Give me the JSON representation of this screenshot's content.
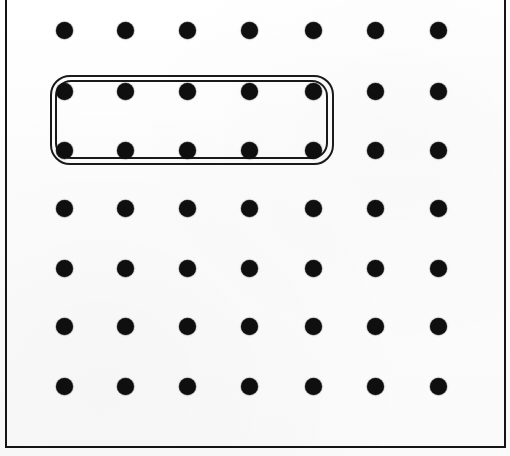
{
  "figure": {
    "name": "dot-grid-with-selection",
    "width": 510,
    "height": 456,
    "background_color": "#fdfdfd",
    "ink_color": "#100f0f"
  },
  "frame": {
    "name": "page-border",
    "color": "#141414",
    "left_x": 5,
    "right_x": 504,
    "top_y": -2,
    "bottom_y": 446,
    "stroke_width": 2.2
  },
  "grid": {
    "columns": 7,
    "rows": 6,
    "dot_diameter": 17,
    "column_x": [
      64,
      125,
      187,
      249,
      313,
      375,
      438
    ],
    "row_y": [
      30,
      91,
      150,
      208,
      268,
      326,
      386
    ],
    "row_count_note": "6 visible rows of dots",
    "rows_y_used": [
      30,
      91,
      150,
      208,
      268,
      326,
      386
    ],
    "dots": [
      {
        "row": 1,
        "col": 1,
        "x": 64,
        "y": 30,
        "selected": false
      },
      {
        "row": 1,
        "col": 2,
        "x": 125,
        "y": 30,
        "selected": false
      },
      {
        "row": 1,
        "col": 3,
        "x": 187,
        "y": 30,
        "selected": false
      },
      {
        "row": 1,
        "col": 4,
        "x": 249,
        "y": 30,
        "selected": false
      },
      {
        "row": 1,
        "col": 5,
        "x": 313,
        "y": 30,
        "selected": false
      },
      {
        "row": 1,
        "col": 6,
        "x": 375,
        "y": 30,
        "selected": false
      },
      {
        "row": 1,
        "col": 7,
        "x": 438,
        "y": 30,
        "selected": false
      },
      {
        "row": 2,
        "col": 1,
        "x": 64,
        "y": 91,
        "selected": true
      },
      {
        "row": 2,
        "col": 2,
        "x": 125,
        "y": 91,
        "selected": true
      },
      {
        "row": 2,
        "col": 3,
        "x": 187,
        "y": 91,
        "selected": true
      },
      {
        "row": 2,
        "col": 4,
        "x": 249,
        "y": 91,
        "selected": true
      },
      {
        "row": 2,
        "col": 5,
        "x": 313,
        "y": 91,
        "selected": true
      },
      {
        "row": 2,
        "col": 6,
        "x": 375,
        "y": 91,
        "selected": false
      },
      {
        "row": 2,
        "col": 7,
        "x": 438,
        "y": 91,
        "selected": false
      },
      {
        "row": 3,
        "col": 1,
        "x": 64,
        "y": 150,
        "selected": true
      },
      {
        "row": 3,
        "col": 2,
        "x": 125,
        "y": 150,
        "selected": true
      },
      {
        "row": 3,
        "col": 3,
        "x": 187,
        "y": 150,
        "selected": true
      },
      {
        "row": 3,
        "col": 4,
        "x": 249,
        "y": 150,
        "selected": true
      },
      {
        "row": 3,
        "col": 5,
        "x": 313,
        "y": 150,
        "selected": true
      },
      {
        "row": 3,
        "col": 6,
        "x": 375,
        "y": 150,
        "selected": false
      },
      {
        "row": 3,
        "col": 7,
        "x": 438,
        "y": 150,
        "selected": false
      },
      {
        "row": 4,
        "col": 1,
        "x": 64,
        "y": 208,
        "selected": false
      },
      {
        "row": 4,
        "col": 2,
        "x": 125,
        "y": 208,
        "selected": false
      },
      {
        "row": 4,
        "col": 3,
        "x": 187,
        "y": 208,
        "selected": false
      },
      {
        "row": 4,
        "col": 4,
        "x": 249,
        "y": 208,
        "selected": false
      },
      {
        "row": 4,
        "col": 5,
        "x": 313,
        "y": 208,
        "selected": false
      },
      {
        "row": 4,
        "col": 6,
        "x": 375,
        "y": 208,
        "selected": false
      },
      {
        "row": 4,
        "col": 7,
        "x": 438,
        "y": 208,
        "selected": false
      },
      {
        "row": 5,
        "col": 1,
        "x": 64,
        "y": 268,
        "selected": false
      },
      {
        "row": 5,
        "col": 2,
        "x": 125,
        "y": 268,
        "selected": false
      },
      {
        "row": 5,
        "col": 3,
        "x": 187,
        "y": 268,
        "selected": false
      },
      {
        "row": 5,
        "col": 4,
        "x": 249,
        "y": 268,
        "selected": false
      },
      {
        "row": 5,
        "col": 5,
        "x": 313,
        "y": 268,
        "selected": false
      },
      {
        "row": 5,
        "col": 6,
        "x": 375,
        "y": 268,
        "selected": false
      },
      {
        "row": 5,
        "col": 7,
        "x": 438,
        "y": 268,
        "selected": false
      },
      {
        "row": 6,
        "col": 1,
        "x": 64,
        "y": 326,
        "selected": false
      },
      {
        "row": 6,
        "col": 2,
        "x": 125,
        "y": 326,
        "selected": false
      },
      {
        "row": 6,
        "col": 3,
        "x": 187,
        "y": 326,
        "selected": false
      },
      {
        "row": 6,
        "col": 4,
        "x": 249,
        "y": 326,
        "selected": false
      },
      {
        "row": 6,
        "col": 5,
        "x": 313,
        "y": 326,
        "selected": false
      },
      {
        "row": 6,
        "col": 6,
        "x": 375,
        "y": 326,
        "selected": false
      },
      {
        "row": 6,
        "col": 7,
        "x": 438,
        "y": 326,
        "selected": false
      },
      {
        "row": 7,
        "col": 1,
        "x": 64,
        "y": 386,
        "selected": false
      },
      {
        "row": 7,
        "col": 2,
        "x": 125,
        "y": 386,
        "selected": false
      },
      {
        "row": 7,
        "col": 3,
        "x": 187,
        "y": 386,
        "selected": false
      },
      {
        "row": 7,
        "col": 4,
        "x": 249,
        "y": 386,
        "selected": false
      },
      {
        "row": 7,
        "col": 5,
        "x": 313,
        "y": 386,
        "selected": false
      },
      {
        "row": 7,
        "col": 6,
        "x": 375,
        "y": 386,
        "selected": false
      },
      {
        "row": 7,
        "col": 7,
        "x": 438,
        "y": 386,
        "selected": false
      }
    ]
  },
  "selection": {
    "name": "selection-rect",
    "shape": "rounded-rectangle",
    "style": "double-stroke",
    "x": 50,
    "y": 75,
    "width": 284,
    "height": 90,
    "corner_radius": 20,
    "stroke_color": "#1a1a1a",
    "stroke_width": 2.3,
    "encloses_columns": [
      1,
      2,
      3,
      4,
      5
    ],
    "encloses_rows": [
      2,
      3
    ],
    "enclosed_dot_count": 10
  }
}
